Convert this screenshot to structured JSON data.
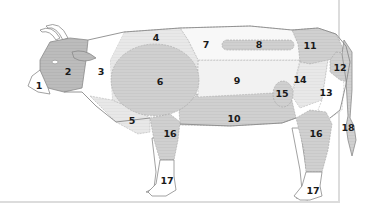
{
  "diagram": {
    "colors": {
      "outline": "#8a8a8a",
      "light": "#ebebeb",
      "mid": "#d4d4d4",
      "dark": "#b8b8b8",
      "white": "#ffffff",
      "frame": "#dcdcdc",
      "label": "#1a1a1a"
    },
    "regions": [
      {
        "id": 1,
        "label": "1"
      },
      {
        "id": 2,
        "label": "2"
      },
      {
        "id": 3,
        "label": "3"
      },
      {
        "id": 4,
        "label": "4"
      },
      {
        "id": 5,
        "label": "5"
      },
      {
        "id": 6,
        "label": "6"
      },
      {
        "id": 7,
        "label": "7"
      },
      {
        "id": 8,
        "label": "8"
      },
      {
        "id": 9,
        "label": "9"
      },
      {
        "id": 10,
        "label": "10"
      },
      {
        "id": 11,
        "label": "11"
      },
      {
        "id": 12,
        "label": "12"
      },
      {
        "id": 13,
        "label": "13"
      },
      {
        "id": 14,
        "label": "14"
      },
      {
        "id": 15,
        "label": "15"
      },
      {
        "id": 16,
        "label": "16"
      },
      {
        "id": 17,
        "label": "17"
      },
      {
        "id": 18,
        "label": "18"
      }
    ],
    "labels": {
      "r1": "1",
      "r2": "2",
      "r3": "3",
      "r4": "4",
      "r5": "5",
      "r6": "6",
      "r7": "7",
      "r8": "8",
      "r9": "9",
      "r10": "10",
      "r11": "11",
      "r12": "12",
      "r13": "13",
      "r14": "14",
      "r15": "15",
      "r16_front": "16",
      "r16_hind": "16",
      "r17_front": "17",
      "r17_hind": "17",
      "r18": "18"
    }
  }
}
